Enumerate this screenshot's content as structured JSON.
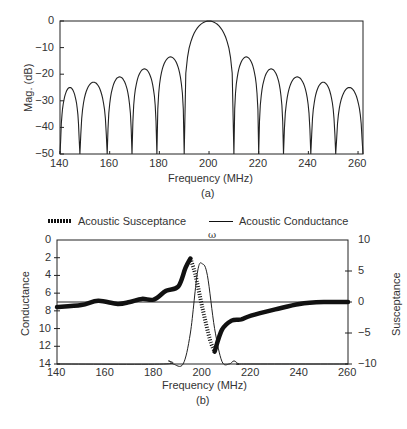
{
  "chart_data": [
    {
      "type": "line",
      "title": "",
      "subtitle": "(a)",
      "xlabel": "Frequency (MHz)",
      "ylabel": "Mag. (dB)",
      "xlim": [
        140,
        262
      ],
      "ylim": [
        -50,
        0
      ],
      "xticks": [
        140,
        160,
        180,
        200,
        220,
        240,
        260
      ],
      "yticks": [
        0,
        -10,
        -20,
        -30,
        -40,
        -50
      ],
      "grid": false,
      "series": [
        {
          "name": "Frequency response (sinc)",
          "lobes": [
            {
              "center": 143,
              "peak_db": -25
            },
            {
              "center": 154,
              "peak_db": -23
            },
            {
              "center": 164,
              "peak_db": -21
            },
            {
              "center": 174,
              "peak_db": -18
            },
            {
              "center": 185,
              "peak_db": -13.5
            },
            {
              "center": 200,
              "peak_db": 0
            },
            {
              "center": 214,
              "peak_db": -13.5
            },
            {
              "center": 225,
              "peak_db": -18
            },
            {
              "center": 235,
              "peak_db": -21
            },
            {
              "center": 246,
              "peak_db": -23
            },
            {
              "center": 256,
              "peak_db": -25
            }
          ],
          "nulls": [
            148,
            159,
            169,
            179,
            190,
            210,
            220,
            230,
            241,
            251,
            262
          ]
        }
      ]
    },
    {
      "type": "line",
      "title": "",
      "subtitle": "(b)",
      "annotation": "ω",
      "xlabel": "Frequency (MHz)",
      "ylabel": "Conductance",
      "y2label": "Susceptance",
      "xlim": [
        140,
        260
      ],
      "ylim": [
        0,
        14
      ],
      "y2lim": [
        -10,
        10
      ],
      "xticks": [
        140,
        160,
        180,
        200,
        220,
        240,
        260
      ],
      "yticks": [
        0,
        2,
        4,
        6,
        8,
        10,
        12,
        14
      ],
      "y2ticks": [
        10,
        5,
        0,
        -5,
        -10
      ],
      "grid": false,
      "legend_position": "top",
      "series": [
        {
          "name": "Acoustic Susceptance",
          "style": "thick/dotted",
          "axis": "right",
          "x": [
            140,
            150,
            157,
            165,
            170,
            175,
            180,
            185,
            190,
            193,
            195,
            197,
            200,
            203,
            205,
            208,
            212,
            216,
            220,
            230,
            240,
            250,
            260
          ],
          "y": [
            -0.8,
            -0.5,
            0.2,
            -0.3,
            0.0,
            0.5,
            0.4,
            1.8,
            2.5,
            5.5,
            7.0,
            4.5,
            -1.0,
            -6.0,
            -8.0,
            -4.5,
            -3.0,
            -2.8,
            -2.2,
            -1.2,
            -0.3,
            0,
            0
          ]
        },
        {
          "name": "Acoustic Conductance",
          "style": "thin solid",
          "axis": "left",
          "x": [
            140,
            184,
            186,
            188,
            192,
            195,
            198,
            200,
            202,
            205,
            208,
            211,
            213,
            215,
            218,
            260
          ],
          "y": [
            0,
            0,
            0.35,
            0,
            0,
            3.5,
            10.5,
            11.3,
            10.0,
            4.0,
            0.3,
            0,
            0.35,
            0,
            0,
            0
          ]
        },
        {
          "name": "Susceptance zero line",
          "style": "thin solid",
          "axis": "right",
          "x": [
            140,
            260
          ],
          "y": [
            0,
            0
          ]
        }
      ]
    }
  ],
  "chartA": {
    "ylabel": "Mag. (dB)",
    "xlabel": "Frequency (MHz)",
    "sub": "(a)",
    "yticks": [
      "0",
      "−10",
      "−20",
      "−30",
      "−40",
      "−50"
    ],
    "xticks": [
      "140",
      "160",
      "180",
      "200",
      "220",
      "240",
      "260"
    ]
  },
  "chartB": {
    "ylabel": "Conductance",
    "y2label": "Susceptance",
    "xlabel": "Frequency (MHz)",
    "sub": "(b)",
    "omega": "ω",
    "legend_susceptance": "Acoustic Susceptance",
    "legend_conductance": "Acoustic Conductance",
    "yticks": [
      "14",
      "12",
      "10",
      "8",
      "6",
      "4",
      "2",
      "0"
    ],
    "y2ticks": [
      "10",
      "5",
      "0",
      "−5",
      "−10"
    ],
    "xticks": [
      "140",
      "160",
      "180",
      "200",
      "220",
      "240",
      "260"
    ]
  }
}
